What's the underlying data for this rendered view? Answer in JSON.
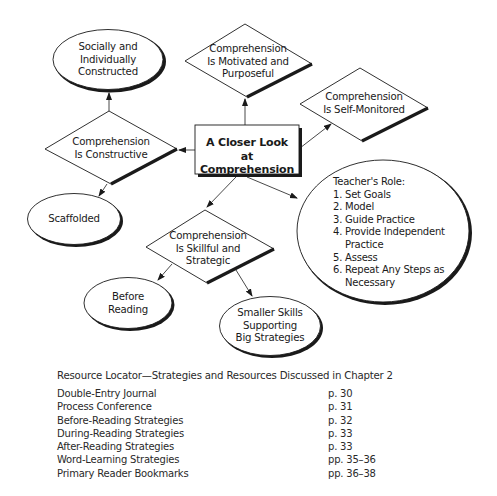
{
  "diagram": {
    "center": {
      "lines": [
        "A Closer Look",
        "at Comprehension"
      ]
    },
    "nodes": {
      "socially": {
        "lines": [
          "Socially and",
          "Individually",
          "Constructed"
        ]
      },
      "motivated": {
        "lines": [
          "Comprehension",
          "Is Motivated and",
          "Purposeful"
        ]
      },
      "self_monitored": {
        "lines": [
          "Comprehension",
          "Is Self-Monitored"
        ]
      },
      "constructive": {
        "lines": [
          "Comprehension",
          "Is Constructive"
        ]
      },
      "scaffolded": {
        "lines": [
          "Scaffolded"
        ]
      },
      "skillful": {
        "lines": [
          "Comprehension",
          "Is Skillful and",
          "Strategic"
        ]
      },
      "before_reading": {
        "lines": [
          "Before",
          "Reading"
        ]
      },
      "smaller_skills": {
        "lines": [
          "Smaller Skills",
          "Supporting",
          "Big Strategies"
        ]
      }
    },
    "teacher_role": {
      "title": "Teacher's Role:",
      "steps": [
        {
          "num": "1.",
          "text": "Set Goals"
        },
        {
          "num": "2.",
          "text": "Model"
        },
        {
          "num": "3.",
          "text": "Guide Practice"
        },
        {
          "num": "4.",
          "text": "Provide Independent"
        },
        {
          "num": "",
          "text": "Practice"
        },
        {
          "num": "5.",
          "text": "Assess"
        },
        {
          "num": "6.",
          "text": "Repeat Any Steps as"
        },
        {
          "num": "",
          "text": "Necessary"
        }
      ]
    }
  },
  "resource_locator": {
    "heading": "Resource Locator—Strategies and Resources Discussed in Chapter 2",
    "rows": [
      {
        "name": "Double-Entry Journal",
        "page": "p. 30"
      },
      {
        "name": "Process Conference",
        "page": "p. 31"
      },
      {
        "name": "Before-Reading Strategies",
        "page": "p. 32"
      },
      {
        "name": "During-Reading Strategies",
        "page": "p. 33"
      },
      {
        "name": "After-Reading Strategies",
        "page": "p. 33"
      },
      {
        "name": "Word-Learning Strategies",
        "page": "pp. 35–36"
      },
      {
        "name": "Primary Reader Bookmarks",
        "page": "pp. 36–38"
      }
    ]
  }
}
